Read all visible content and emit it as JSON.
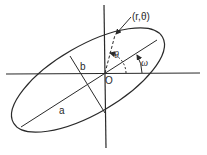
{
  "diagram": {
    "labels": {
      "point": "(r,θ)",
      "theta": "θ",
      "omega": "ω",
      "origin": "O",
      "semi_major": "a",
      "semi_minor": "b"
    },
    "colors": {
      "stroke": "#2a2a2a",
      "background": "#ffffff"
    }
  }
}
